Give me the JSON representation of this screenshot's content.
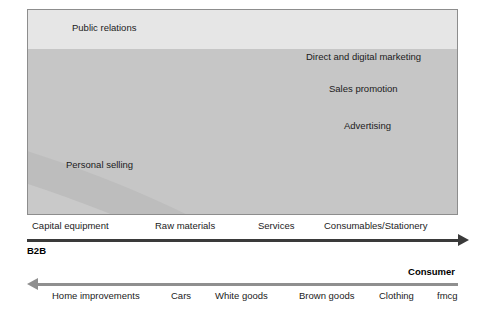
{
  "figure": {
    "type": "area-band-diagram"
  },
  "chart_data": {
    "type": "area",
    "title": "",
    "xlabel": "",
    "ylabel": "",
    "grid": false,
    "legend_position": "inline-labels",
    "bands": [
      {
        "name": "Public relations",
        "label": "Public relations",
        "color": "#e6e6e6",
        "label_x": 44,
        "label_y": 12,
        "order": 1
      },
      {
        "name": "Direct and digital marketing",
        "label": "Direct and digital marketing",
        "color": "#c6c6c6",
        "label_x": 278,
        "label_y": 41,
        "order": 2
      },
      {
        "name": "Sales promotion",
        "label": "Sales promotion",
        "color": "#bdbdbd",
        "label_x": 301,
        "label_y": 73,
        "order": 3
      },
      {
        "name": "Advertising",
        "label": "Advertising",
        "color": "#c9c9c9",
        "label_x": 316,
        "label_y": 110,
        "order": 4
      },
      {
        "name": "Personal selling",
        "label": "Personal selling",
        "color": "#ebebeb",
        "label_x": 38,
        "label_y": 149,
        "order": 5
      }
    ]
  },
  "axes": {
    "b2b": {
      "caption": "B2B",
      "direction": "right",
      "arrow_color": "#3a3a3a",
      "ticks": [
        {
          "label": "Capital equipment",
          "x": 5
        },
        {
          "label": "Raw materials",
          "x": 128
        },
        {
          "label": "Services",
          "x": 231
        },
        {
          "label": "Consumables/Stationery",
          "x": 297
        }
      ]
    },
    "consumer": {
      "caption": "Consumer",
      "direction": "left",
      "arrow_color": "#8f8f8f",
      "ticks": [
        {
          "label": "Home improvements",
          "x": 25
        },
        {
          "label": "Cars",
          "x": 144
        },
        {
          "label": "White goods",
          "x": 188
        },
        {
          "label": "Brown goods",
          "x": 272
        },
        {
          "label": "Clothing",
          "x": 352
        },
        {
          "label": "fmcg",
          "x": 410
        }
      ]
    }
  }
}
